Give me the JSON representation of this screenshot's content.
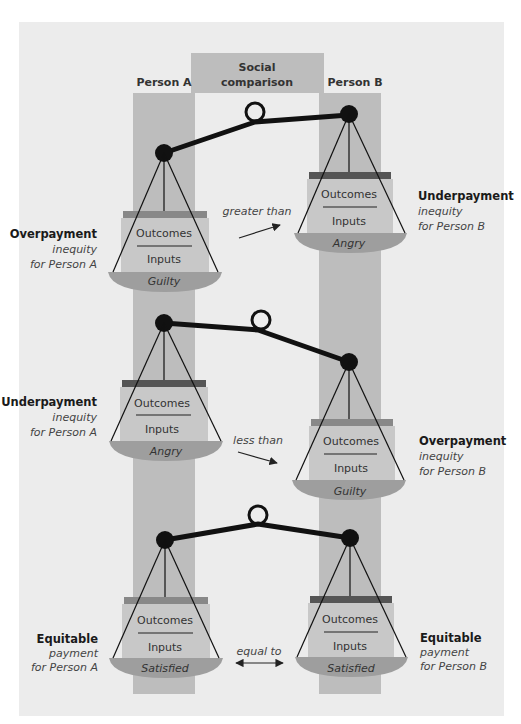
{
  "header": {
    "person_a": "Person A",
    "social_line1": "Social",
    "social_line2": "comparison",
    "person_b": "Person B"
  },
  "colors": {
    "panel": "#ececec",
    "column": "#bdbdbd",
    "header_box": "#bdbdbd",
    "box": "#c8c8c8",
    "pan": "#9e9e9e",
    "bar_dark": "#555555",
    "bar_light": "#888888"
  },
  "rows": [
    {
      "left": {
        "title": "Overpayment",
        "line2": "inequity",
        "line3": "for Person A",
        "outcomes": "Outcomes",
        "inputs": "Inputs",
        "emotion": "Guilty"
      },
      "relation": "greater than",
      "right": {
        "title": "Underpayment",
        "line2": "inequity",
        "line3": "for Person B",
        "outcomes": "Outcomes",
        "inputs": "Inputs",
        "emotion": "Angry"
      }
    },
    {
      "left": {
        "title": "Underpayment",
        "line2": "inequity",
        "line3": "for Person A",
        "outcomes": "Outcomes",
        "inputs": "Inputs",
        "emotion": "Angry"
      },
      "relation": "less than",
      "right": {
        "title": "Overpayment",
        "line2": "inequity",
        "line3": "for Person B",
        "outcomes": "Outcomes",
        "inputs": "Inputs",
        "emotion": "Guilty"
      }
    },
    {
      "left": {
        "title": "Equitable",
        "line2": "payment",
        "line3": "for Person A",
        "outcomes": "Outcomes",
        "inputs": "Inputs",
        "emotion": "Satisfied"
      },
      "relation": "equal to",
      "right": {
        "title": "Equitable",
        "line2": "payment",
        "line3": "for Person B",
        "outcomes": "Outcomes",
        "inputs": "Inputs",
        "emotion": "Satisfied"
      }
    }
  ]
}
